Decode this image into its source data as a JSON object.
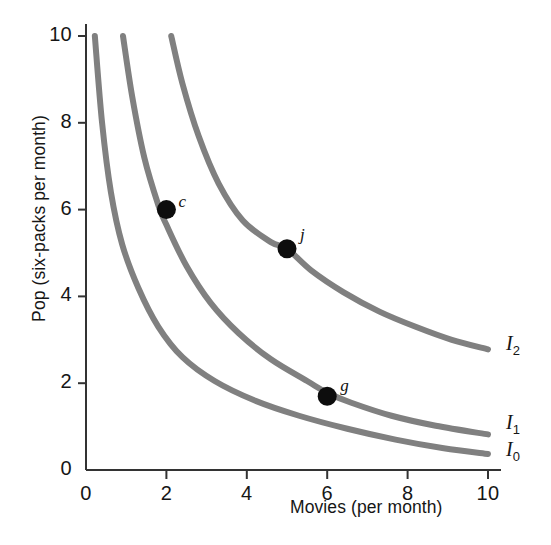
{
  "chart_data": {
    "type": "line",
    "title": "",
    "xlabel": "Movies (per month)",
    "ylabel": "Pop (six-packs per month)",
    "xlim": [
      0,
      10
    ],
    "ylim": [
      0,
      10
    ],
    "xticks": [
      "0",
      "2",
      "4",
      "6",
      "8",
      "10"
    ],
    "yticks": [
      "0",
      "2",
      "4",
      "6",
      "8",
      "10"
    ],
    "grid": false,
    "legend_position": "inline-right",
    "curve_color": "#808080",
    "point_color": "#0d0d0d",
    "axis_color": "#333333",
    "series": [
      {
        "name": "I0",
        "label": "I",
        "subscript": "0",
        "label_x": 10.45,
        "label_y": 0.36,
        "points": [
          [
            0.22,
            10.0
          ],
          [
            0.4,
            8.0
          ],
          [
            0.62,
            6.4
          ],
          [
            0.9,
            5.2
          ],
          [
            1.3,
            4.2
          ],
          [
            1.8,
            3.3
          ],
          [
            2.4,
            2.6
          ],
          [
            3.2,
            2.05
          ],
          [
            4.2,
            1.6
          ],
          [
            5.3,
            1.25
          ],
          [
            6.5,
            0.95
          ],
          [
            7.7,
            0.7
          ],
          [
            8.9,
            0.5
          ],
          [
            10.0,
            0.37
          ]
        ]
      },
      {
        "name": "I1",
        "label": "I",
        "subscript": "1",
        "label_x": 10.45,
        "label_y": 1.0,
        "points": [
          [
            0.92,
            10.0
          ],
          [
            1.15,
            8.6
          ],
          [
            1.45,
            7.2
          ],
          [
            1.8,
            6.1
          ],
          [
            2.0,
            5.65
          ],
          [
            2.5,
            4.7
          ],
          [
            3.1,
            3.85
          ],
          [
            3.8,
            3.15
          ],
          [
            4.6,
            2.55
          ],
          [
            5.5,
            2.05
          ],
          [
            6.0,
            1.78
          ],
          [
            6.6,
            1.55
          ],
          [
            7.6,
            1.25
          ],
          [
            8.7,
            1.02
          ],
          [
            10.0,
            0.82
          ]
        ]
      },
      {
        "name": "I2",
        "label": "I",
        "subscript": "2",
        "label_x": 10.45,
        "label_y": 2.82,
        "points": [
          [
            2.12,
            10.0
          ],
          [
            2.4,
            8.9
          ],
          [
            2.8,
            7.7
          ],
          [
            3.3,
            6.6
          ],
          [
            3.9,
            5.75
          ],
          [
            4.6,
            5.25
          ],
          [
            5.0,
            5.1
          ],
          [
            5.6,
            4.6
          ],
          [
            6.4,
            4.1
          ],
          [
            7.3,
            3.65
          ],
          [
            8.2,
            3.3
          ],
          [
            9.1,
            3.0
          ],
          [
            10.0,
            2.78
          ]
        ]
      }
    ],
    "annotations": [
      {
        "name": "point-c",
        "label": "c",
        "x": 2.0,
        "y": 6.0,
        "on_curve": "I1",
        "label_dx": 12,
        "label_dy": -10
      },
      {
        "name": "point-j",
        "label": "j",
        "x": 5.0,
        "y": 5.1,
        "on_curve": "I2",
        "label_dx": 13,
        "label_dy": -16
      },
      {
        "name": "point-g",
        "label": "g",
        "x": 6.0,
        "y": 1.7,
        "on_curve": "I1",
        "label_dx": 13,
        "label_dy": -12
      }
    ]
  }
}
